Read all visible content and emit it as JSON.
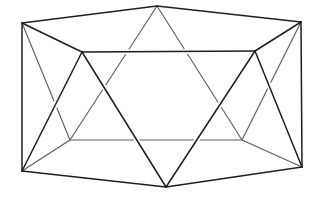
{
  "figure": {
    "stroke_color": "#1e1e1e",
    "hidden_color": "#5a5a5a",
    "background": "#ffffff",
    "vertices": {
      "A": [
        157,
        6
      ],
      "B": [
        22,
        23
      ],
      "C": [
        301,
        22
      ],
      "D": [
        82,
        52
      ],
      "E": [
        255,
        51
      ],
      "F": [
        166,
        187
      ],
      "G": [
        22,
        171
      ],
      "H": [
        302,
        167
      ],
      "I": [
        70,
        140
      ],
      "J": [
        242,
        140
      ]
    },
    "hidden_edges": [
      [
        "A",
        "I"
      ],
      [
        "A",
        "J"
      ],
      [
        "B",
        "I"
      ],
      [
        "C",
        "J"
      ],
      [
        "I",
        "J"
      ],
      [
        "G",
        "I"
      ],
      [
        "H",
        "J"
      ]
    ],
    "front_edges": [
      [
        "B",
        "A"
      ],
      [
        "A",
        "C"
      ],
      [
        "B",
        "D"
      ],
      [
        "D",
        "E"
      ],
      [
        "E",
        "C"
      ],
      [
        "B",
        "G"
      ],
      [
        "C",
        "H"
      ],
      [
        "G",
        "F"
      ],
      [
        "F",
        "H"
      ],
      [
        "D",
        "G"
      ],
      [
        "D",
        "F"
      ],
      [
        "E",
        "F"
      ],
      [
        "E",
        "H"
      ]
    ]
  }
}
